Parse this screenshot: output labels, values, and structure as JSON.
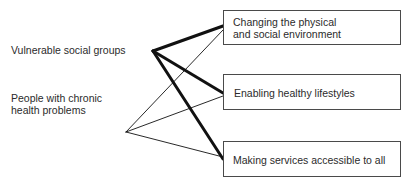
{
  "diagram": {
    "groups": [
      {
        "id": "vulnerable",
        "label": "Vulnerable social groups"
      },
      {
        "id": "chronic",
        "label_line1": "People with chronic",
        "label_line2": "health problems"
      }
    ],
    "actions": [
      {
        "id": "environment",
        "label_line1": "Changing the physical",
        "label_line2": "and social environment"
      },
      {
        "id": "lifestyles",
        "label": "Enabling healthy lifestyles"
      },
      {
        "id": "services",
        "label": "Making services accessible to all"
      }
    ],
    "connections": [
      {
        "from": "vulnerable",
        "to": "environment",
        "weight": "thick"
      },
      {
        "from": "vulnerable",
        "to": "lifestyles",
        "weight": "thick"
      },
      {
        "from": "vulnerable",
        "to": "services",
        "weight": "thick"
      },
      {
        "from": "chronic",
        "to": "environment",
        "weight": "thin"
      },
      {
        "from": "chronic",
        "to": "lifestyles",
        "weight": "thin"
      },
      {
        "from": "chronic",
        "to": "services",
        "weight": "thin"
      }
    ]
  }
}
